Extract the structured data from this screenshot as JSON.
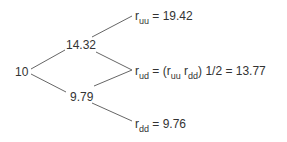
{
  "tree": {
    "root": {
      "value": "10"
    },
    "up": {
      "value": "14.32"
    },
    "down": {
      "value": "9.79"
    },
    "leaves": {
      "uu": {
        "symbol": "r",
        "sub": "uu",
        "expr": " = 19.42"
      },
      "ud": {
        "symbol": "r",
        "sub": "ud",
        "expr_pre": " = (",
        "a_sym": "r",
        "a_sub": "uu",
        "b_sym": " r",
        "b_sub": "dd",
        "expr_post": ") 1/2 = 13.77"
      },
      "dd": {
        "symbol": "r",
        "sub": "dd",
        "expr": " = 9.76"
      }
    },
    "line_color": "#666666"
  }
}
